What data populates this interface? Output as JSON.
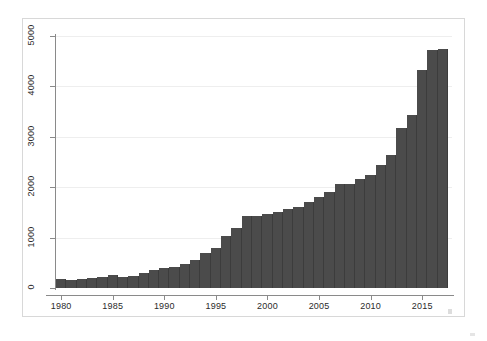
{
  "figure": {
    "title": "",
    "background_color": "#ffffff",
    "bar_color": "#4b4b4b",
    "grid_color": "#eeeeee",
    "axis_color": "#8a8a8a"
  },
  "chart_data": {
    "type": "bar",
    "title": "",
    "xlabel": "",
    "ylabel": "",
    "xlim": [
      1979.5,
      2017.5
    ],
    "ylim": [
      0,
      5000
    ],
    "grid": true,
    "legend": null,
    "x_tick_labels": [
      "1980",
      "1985",
      "1990",
      "1995",
      "2000",
      "2005",
      "2010",
      "2015"
    ],
    "x_tick_values": [
      1980,
      1985,
      1990,
      1995,
      2000,
      2005,
      2010,
      2015
    ],
    "y_tick_labels": [
      "0",
      "1000",
      "2000",
      "3000",
      "4000",
      "5000"
    ],
    "y_tick_values": [
      0,
      1000,
      2000,
      3000,
      4000,
      5000
    ],
    "categories": [
      "1980",
      "1981",
      "1982",
      "1983",
      "1984",
      "1985",
      "1986",
      "1987",
      "1988",
      "1989",
      "1990",
      "1991",
      "1992",
      "1993",
      "1994",
      "1995",
      "1996",
      "1997",
      "1998",
      "1999",
      "2000",
      "2001",
      "2002",
      "2003",
      "2004",
      "2005",
      "2006",
      "2007",
      "2008",
      "2009",
      "2010",
      "2011",
      "2012",
      "2013",
      "2014",
      "2015",
      "2016",
      "2017"
    ],
    "values": [
      170,
      150,
      180,
      200,
      215,
      250,
      215,
      230,
      290,
      360,
      390,
      420,
      470,
      550,
      700,
      800,
      1040,
      1200,
      1420,
      1430,
      1460,
      1500,
      1560,
      1600,
      1700,
      1800,
      1900,
      2060,
      2070,
      2160,
      2250,
      2450,
      2630,
      3180,
      3430,
      4330,
      4720,
      4290
    ],
    "last_bar_value": 4750
  }
}
